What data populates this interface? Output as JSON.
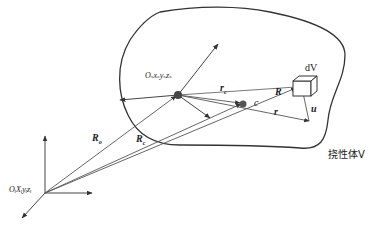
{
  "diagram": {
    "body_label": "挠性体V",
    "frames": {
      "inertial": "O_i X_i y_i z_i",
      "inertial_display": "OᵢXᵢyᵢzᵢ",
      "body": "O_s x_s y_s z_s",
      "body_display": "Oₛxₛyₛzₛ"
    },
    "vectors": {
      "R_o": "R",
      "R_o_sub": "o",
      "R_c": "R",
      "R_c_sub": "c",
      "r_c": "r",
      "r_c_sub": "c",
      "R": "R",
      "r": "r",
      "u": "u"
    },
    "points": {
      "centroid": "c",
      "volume_element": "dV"
    },
    "colors": {
      "line": "#555555",
      "outline": "#333333",
      "dot": "#444444",
      "text": "#222222"
    }
  }
}
